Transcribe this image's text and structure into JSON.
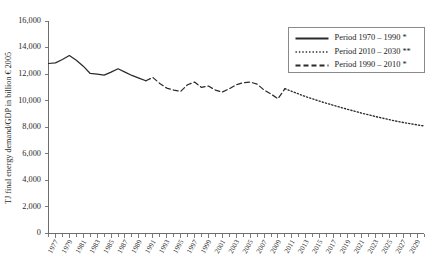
{
  "chart_data": {
    "type": "line",
    "title": "",
    "subtitle": "",
    "xlabel": "",
    "ylabel": "TJ final energy demand/GDP in billion € 2005",
    "xlim": [
      1976,
      2030
    ],
    "ylim": [
      0,
      16000
    ],
    "grid": false,
    "legend_position": "top-right",
    "y_ticks": [
      0,
      2000,
      4000,
      6000,
      8000,
      10000,
      12000,
      14000,
      16000
    ],
    "y_tick_labels": [
      "0",
      "2,000",
      "4,000",
      "6,000",
      "8,000",
      "10,000",
      "12,000",
      "14,000",
      "16,000"
    ],
    "x_ticks": [
      1977,
      1979,
      1981,
      1983,
      1985,
      1987,
      1989,
      1991,
      1993,
      1995,
      1997,
      1999,
      2001,
      2003,
      2005,
      2007,
      2009,
      2011,
      2013,
      2015,
      2017,
      2019,
      2021,
      2023,
      2025,
      2027,
      2029
    ],
    "x_tick_labels": [
      "1977",
      "1979",
      "1981",
      "1983",
      "1985",
      "1987",
      "1989",
      "1991",
      "1993",
      "1995",
      "1997",
      "1999",
      "2001",
      "2003",
      "2005",
      "2007",
      "2009",
      "2011",
      "2013",
      "2015",
      "2017",
      "2019",
      "2021",
      "2023",
      "2025",
      "2027",
      "2029"
    ],
    "series": [
      {
        "name": "Period 1970 – 1990 *",
        "style": "solid",
        "color": "#2a2a2a",
        "x": [
          1976,
          1977,
          1978,
          1979,
          1980,
          1981,
          1982,
          1983,
          1984,
          1985,
          1986,
          1987,
          1988,
          1989,
          1990
        ],
        "values": [
          12800,
          12850,
          13100,
          13400,
          13050,
          12600,
          12050,
          12000,
          11920,
          12150,
          12400,
          12150,
          11900,
          11700,
          11500
        ]
      },
      {
        "name": "Period 1990 – 2010 *",
        "style": "dashed",
        "color": "#2a2a2a",
        "x": [
          1990,
          1991,
          1992,
          1993,
          1994,
          1995,
          1996,
          1997,
          1998,
          1999,
          2000,
          2001,
          2002,
          2003,
          2004,
          2005,
          2006,
          2007,
          2008,
          2009,
          2010
        ],
        "values": [
          11500,
          11750,
          11300,
          10950,
          10800,
          10700,
          11200,
          11400,
          11000,
          11100,
          10800,
          10650,
          10900,
          11200,
          11350,
          11400,
          11250,
          10800,
          10500,
          10150,
          10900
        ]
      },
      {
        "name": "Period 2010 – 2030 **",
        "style": "dotted",
        "color": "#2a2a2a",
        "x": [
          2010,
          2011,
          2012,
          2013,
          2014,
          2015,
          2016,
          2017,
          2018,
          2019,
          2020,
          2021,
          2022,
          2023,
          2024,
          2025,
          2026,
          2027,
          2028,
          2029,
          2030
        ],
        "values": [
          10900,
          10700,
          10500,
          10300,
          10130,
          9960,
          9800,
          9650,
          9500,
          9350,
          9210,
          9070,
          8940,
          8810,
          8690,
          8570,
          8460,
          8360,
          8270,
          8180,
          8100
        ]
      }
    ],
    "legend": [
      {
        "label": "Period 1970 – 1990 *",
        "style": "solid"
      },
      {
        "label": "Period 2010 – 2030 **",
        "style": "dotted"
      },
      {
        "label": "Period 1990 – 2010 *",
        "style": "dashed"
      }
    ]
  }
}
